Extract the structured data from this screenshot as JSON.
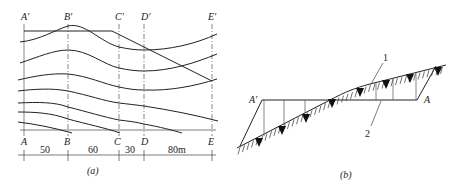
{
  "panel_a": {
    "caption": "(a)",
    "top_labels": [
      "A′",
      "B′",
      "C′",
      "D′",
      "E′"
    ],
    "bottom_labels": [
      "A",
      "B",
      "C",
      "D",
      "E"
    ],
    "dimensions": [
      "50",
      "60",
      "30",
      "80m"
    ]
  },
  "panel_b": {
    "caption": "(b)",
    "label_left": "A′",
    "label_right": "A",
    "callouts": [
      "1",
      "2"
    ]
  }
}
